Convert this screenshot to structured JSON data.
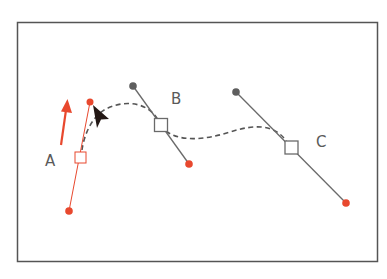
{
  "diagram": {
    "colors": {
      "frame": "#555555",
      "selected": "#e8482e",
      "handle": "#6a6a6a",
      "path": "#555555",
      "cursor": "#231815",
      "label": "#5a5a5a"
    },
    "labels": {
      "a": "A",
      "b": "B",
      "c": "C"
    },
    "anchors": [
      {
        "id": "A",
        "x": 80,
        "y": 157,
        "selected": true,
        "handle_in": {
          "x": 69,
          "y": 211
        },
        "handle_out": {
          "x": 90,
          "y": 102
        }
      },
      {
        "id": "B",
        "x": 161,
        "y": 125,
        "selected": false,
        "handle_in": {
          "x": 133,
          "y": 86
        },
        "handle_out": {
          "x": 189,
          "y": 164
        }
      },
      {
        "id": "C",
        "x": 291,
        "y": 147,
        "selected": false,
        "handle_in": {
          "x": 236,
          "y": 92
        },
        "handle_out": {
          "x": 346,
          "y": 203
        }
      }
    ],
    "drag_arrow": {
      "direction": "up"
    },
    "cursor": {
      "type": "direct-selection-arrow"
    }
  }
}
